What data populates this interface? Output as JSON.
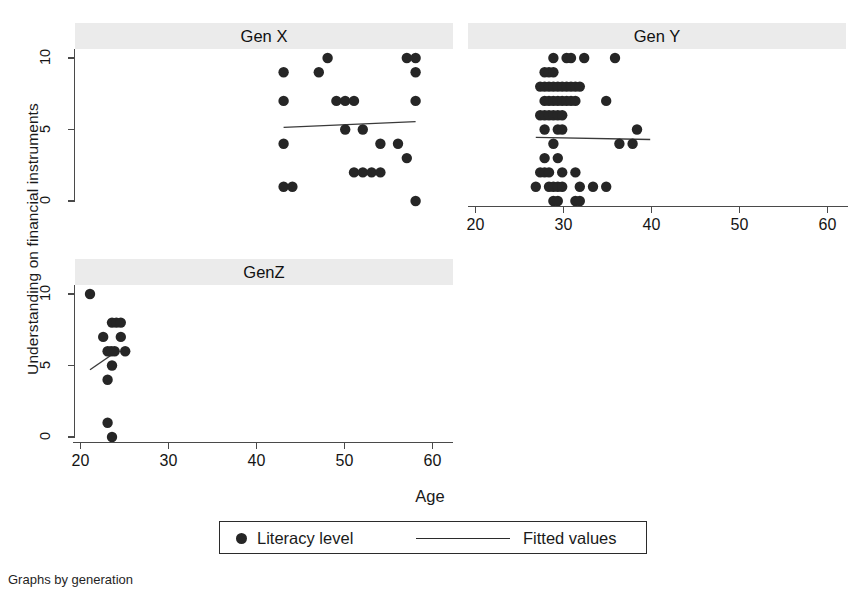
{
  "figure": {
    "y_axis_title": "Understanding on financial instruments",
    "x_axis_title": "Age",
    "footnote": "Graphs by generation",
    "legend": {
      "marker_label": "Literacy level",
      "line_label": "Fitted values"
    }
  },
  "chart_data": {
    "type": "scatter",
    "subtitle": "Graphs by generation",
    "xlabel": "Age",
    "ylabel": "Understanding on financial instruments",
    "xlim": [
      19,
      62
    ],
    "ylim": [
      -0.6,
      10.6
    ],
    "xticks": [
      20,
      30,
      40,
      50,
      60
    ],
    "yticks": [
      0,
      5,
      10
    ],
    "grid": false,
    "legend_position": "bottom-center",
    "legend": [
      "Literacy level",
      "Fitted values"
    ],
    "panels": [
      {
        "name": "Gen X",
        "position": "top-left",
        "x_axis_visible": false,
        "y_axis_visible": true,
        "points": [
          {
            "x": 42,
            "y": 9
          },
          {
            "x": 42,
            "y": 7
          },
          {
            "x": 42,
            "y": 4
          },
          {
            "x": 42,
            "y": 1
          },
          {
            "x": 43,
            "y": 1
          },
          {
            "x": 46,
            "y": 9
          },
          {
            "x": 47,
            "y": 10
          },
          {
            "x": 48,
            "y": 7
          },
          {
            "x": 49,
            "y": 7
          },
          {
            "x": 49,
            "y": 5
          },
          {
            "x": 50,
            "y": 7
          },
          {
            "x": 50,
            "y": 2
          },
          {
            "x": 51,
            "y": 5
          },
          {
            "x": 51,
            "y": 2
          },
          {
            "x": 52,
            "y": 2
          },
          {
            "x": 53,
            "y": 4
          },
          {
            "x": 53,
            "y": 2
          },
          {
            "x": 55,
            "y": 4
          },
          {
            "x": 56,
            "y": 3
          },
          {
            "x": 56,
            "y": 10
          },
          {
            "x": 57,
            "y": 10
          },
          {
            "x": 57,
            "y": 9
          },
          {
            "x": 57,
            "y": 7
          },
          {
            "x": 57,
            "y": 0
          }
        ],
        "fit_line": {
          "x0": 42,
          "y0": 5.15,
          "x1": 57,
          "y1": 5.55
        }
      },
      {
        "name": "Gen Y",
        "position": "top-right",
        "x_axis_visible": true,
        "y_axis_visible": false,
        "points": [
          {
            "x": 28,
            "y": 10
          },
          {
            "x": 29.5,
            "y": 10
          },
          {
            "x": 30,
            "y": 10
          },
          {
            "x": 31.5,
            "y": 10
          },
          {
            "x": 35,
            "y": 10
          },
          {
            "x": 27,
            "y": 9
          },
          {
            "x": 27.5,
            "y": 9
          },
          {
            "x": 28,
            "y": 9
          },
          {
            "x": 26.5,
            "y": 8
          },
          {
            "x": 27,
            "y": 8
          },
          {
            "x": 27.5,
            "y": 8
          },
          {
            "x": 28,
            "y": 8
          },
          {
            "x": 28.5,
            "y": 8
          },
          {
            "x": 29,
            "y": 8
          },
          {
            "x": 29.5,
            "y": 8
          },
          {
            "x": 30,
            "y": 8
          },
          {
            "x": 30.5,
            "y": 8
          },
          {
            "x": 31,
            "y": 8
          },
          {
            "x": 27,
            "y": 7
          },
          {
            "x": 27.5,
            "y": 7
          },
          {
            "x": 28,
            "y": 7
          },
          {
            "x": 28.5,
            "y": 7
          },
          {
            "x": 29,
            "y": 7
          },
          {
            "x": 29.5,
            "y": 7
          },
          {
            "x": 30,
            "y": 7
          },
          {
            "x": 30.5,
            "y": 7
          },
          {
            "x": 34,
            "y": 7
          },
          {
            "x": 26.5,
            "y": 6
          },
          {
            "x": 27,
            "y": 6
          },
          {
            "x": 27.5,
            "y": 6
          },
          {
            "x": 28,
            "y": 6
          },
          {
            "x": 28.5,
            "y": 6
          },
          {
            "x": 29,
            "y": 6
          },
          {
            "x": 27,
            "y": 5
          },
          {
            "x": 28.5,
            "y": 5
          },
          {
            "x": 29,
            "y": 5
          },
          {
            "x": 37.5,
            "y": 5
          },
          {
            "x": 28,
            "y": 4
          },
          {
            "x": 35.5,
            "y": 4
          },
          {
            "x": 37,
            "y": 4
          },
          {
            "x": 27,
            "y": 3
          },
          {
            "x": 28.5,
            "y": 3
          },
          {
            "x": 26.5,
            "y": 2
          },
          {
            "x": 27,
            "y": 2
          },
          {
            "x": 27.5,
            "y": 2
          },
          {
            "x": 29,
            "y": 2
          },
          {
            "x": 30.5,
            "y": 2
          },
          {
            "x": 26,
            "y": 1
          },
          {
            "x": 27.5,
            "y": 1
          },
          {
            "x": 28,
            "y": 1
          },
          {
            "x": 28.5,
            "y": 1
          },
          {
            "x": 29,
            "y": 1
          },
          {
            "x": 31,
            "y": 1
          },
          {
            "x": 32.5,
            "y": 1
          },
          {
            "x": 34,
            "y": 1
          },
          {
            "x": 28,
            "y": 0
          },
          {
            "x": 28.5,
            "y": 0
          },
          {
            "x": 30.5,
            "y": 0
          },
          {
            "x": 31,
            "y": 0
          }
        ],
        "fit_line": {
          "x0": 26,
          "y0": 4.45,
          "x1": 39,
          "y1": 4.3
        }
      },
      {
        "name": "GenZ",
        "position": "bottom-left",
        "x_axis_visible": true,
        "y_axis_visible": true,
        "points": [
          {
            "x": 20,
            "y": 10
          },
          {
            "x": 22.5,
            "y": 8
          },
          {
            "x": 23,
            "y": 8
          },
          {
            "x": 23.5,
            "y": 8
          },
          {
            "x": 21.5,
            "y": 7
          },
          {
            "x": 23.5,
            "y": 7
          },
          {
            "x": 22,
            "y": 6
          },
          {
            "x": 22.4,
            "y": 6
          },
          {
            "x": 22.8,
            "y": 6
          },
          {
            "x": 24,
            "y": 6
          },
          {
            "x": 22.5,
            "y": 5
          },
          {
            "x": 22,
            "y": 4
          },
          {
            "x": 22,
            "y": 1
          },
          {
            "x": 22.5,
            "y": 0
          }
        ],
        "fit_line": {
          "x0": 20,
          "y0": 4.7,
          "x1": 23.3,
          "y1": 6.1
        }
      }
    ]
  }
}
